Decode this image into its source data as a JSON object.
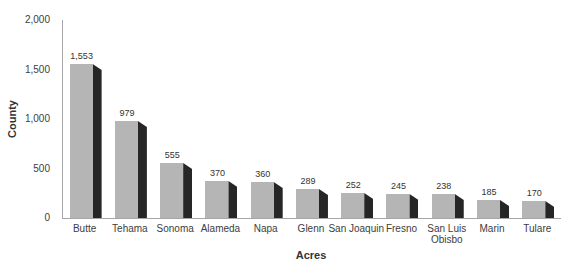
{
  "chart_data": {
    "type": "bar",
    "title": "",
    "xlabel": "Acres",
    "ylabel": "County",
    "ylim": [
      0,
      2000
    ],
    "grid": false,
    "legend": null,
    "bar_color": "#b5b5b5",
    "bar_side_color": "#262626",
    "axis_color": "#a6a6a6",
    "text_color": "#3d3d3d",
    "yticks": [
      {
        "label": "0",
        "value": 0
      },
      {
        "label": "500",
        "value": 500
      },
      {
        "label": "1,000",
        "value": 1000
      },
      {
        "label": "1,500",
        "value": 1500
      },
      {
        "label": "2,000",
        "value": 2000
      }
    ],
    "categories": [
      "Butte",
      "Tehama",
      "Sonoma",
      "Alameda",
      "Napa",
      "Glenn",
      "San Joaquin",
      "Fresno",
      "San Luis\nObisbo",
      "Marin",
      "Tulare"
    ],
    "values": [
      1553,
      979,
      555,
      370,
      360,
      289,
      252,
      245,
      238,
      185,
      170
    ],
    "value_labels": [
      "1,553",
      "979",
      "555",
      "370",
      "360",
      "289",
      "252",
      "245",
      "238",
      "185",
      "170"
    ]
  }
}
